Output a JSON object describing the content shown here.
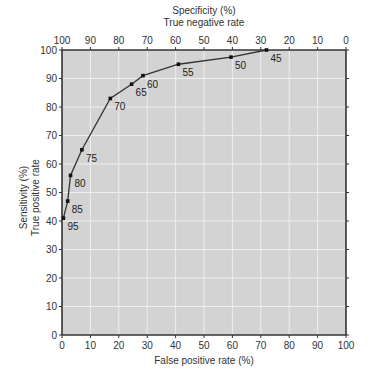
{
  "chart_data": {
    "type": "line",
    "title": "",
    "xlabel": "False positive rate (%)",
    "ylabel": [
      "Sensitivity (%)",
      "True positive rate"
    ],
    "top_xlabel": [
      "Specificity (%)",
      "True negative rate"
    ],
    "xlim": [
      0,
      100
    ],
    "ylim": [
      0,
      100
    ],
    "x_ticks": [
      0,
      10,
      20,
      30,
      40,
      50,
      60,
      70,
      80,
      90,
      100
    ],
    "y_ticks": [
      0,
      10,
      20,
      30,
      40,
      50,
      60,
      70,
      80,
      90,
      100
    ],
    "top_x_ticks": [
      100,
      90,
      80,
      70,
      60,
      50,
      40,
      30,
      20,
      10,
      0
    ],
    "grid": true,
    "legend": null,
    "series": [
      {
        "name": "ROC curve",
        "points": [
          {
            "label": "95",
            "fpr": 0.5,
            "sensitivity": 41
          },
          {
            "label": "85",
            "fpr": 2,
            "sensitivity": 47
          },
          {
            "label": "80",
            "fpr": 3,
            "sensitivity": 56
          },
          {
            "label": "75",
            "fpr": 7,
            "sensitivity": 65
          },
          {
            "label": "70",
            "fpr": 17,
            "sensitivity": 83
          },
          {
            "label": "65",
            "fpr": 24.5,
            "sensitivity": 88
          },
          {
            "label": "60",
            "fpr": 28.5,
            "sensitivity": 91
          },
          {
            "label": "55",
            "fpr": 41,
            "sensitivity": 95
          },
          {
            "label": "50",
            "fpr": 59.5,
            "sensitivity": 97.5
          },
          {
            "label": "45",
            "fpr": 72,
            "sensitivity": 100
          }
        ]
      }
    ]
  },
  "colors": {
    "plot_background": "#d3d3d3",
    "grid": "#eeeeee",
    "axis": "#333333",
    "line": "#333333",
    "point": "#111111"
  }
}
